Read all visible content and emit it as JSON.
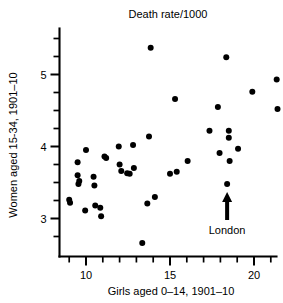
{
  "chart_data": {
    "type": "scatter",
    "title": "Death rate/1000",
    "xlabel": "Girls aged 0–14, 1901–10",
    "ylabel": "Women aged 15-34, 1901–10",
    "xlim": [
      8.8,
      22.0
    ],
    "ylim": [
      2.55,
      5.55
    ],
    "xticks_labeled": [
      10,
      15,
      20
    ],
    "xtick_labels": [
      "10",
      "15",
      "20"
    ],
    "xticks_all": [
      9,
      10,
      11,
      12,
      13,
      14,
      15,
      16,
      17,
      18,
      19,
      20,
      21,
      22
    ],
    "yticks_labeled": [
      3,
      4,
      5
    ],
    "ytick_labels": [
      "3",
      "4",
      "5"
    ],
    "yticks_all": [
      2.75,
      3.0,
      3.25,
      3.5,
      3.75,
      4.0,
      4.25,
      4.5,
      4.75,
      5.0,
      5.25,
      5.5
    ],
    "grid": false,
    "legend": false,
    "marker_color": "#000000",
    "points": [
      {
        "x": 9.0,
        "y": 3.26
      },
      {
        "x": 9.05,
        "y": 3.22
      },
      {
        "x": 9.5,
        "y": 3.78
      },
      {
        "x": 9.5,
        "y": 3.6
      },
      {
        "x": 9.55,
        "y": 3.48
      },
      {
        "x": 9.6,
        "y": 3.52
      },
      {
        "x": 9.95,
        "y": 3.11
      },
      {
        "x": 10.0,
        "y": 3.95
      },
      {
        "x": 10.45,
        "y": 3.58
      },
      {
        "x": 10.5,
        "y": 3.46
      },
      {
        "x": 10.55,
        "y": 3.18
      },
      {
        "x": 10.85,
        "y": 3.15
      },
      {
        "x": 10.9,
        "y": 3.03
      },
      {
        "x": 11.1,
        "y": 3.86
      },
      {
        "x": 11.2,
        "y": 3.84
      },
      {
        "x": 11.95,
        "y": 4.0
      },
      {
        "x": 12.0,
        "y": 3.75
      },
      {
        "x": 12.1,
        "y": 3.66
      },
      {
        "x": 12.45,
        "y": 3.63
      },
      {
        "x": 12.6,
        "y": 3.62
      },
      {
        "x": 12.8,
        "y": 4.02
      },
      {
        "x": 12.85,
        "y": 3.7
      },
      {
        "x": 13.35,
        "y": 2.66
      },
      {
        "x": 13.65,
        "y": 3.21
      },
      {
        "x": 13.75,
        "y": 4.14
      },
      {
        "x": 13.85,
        "y": 5.37
      },
      {
        "x": 14.1,
        "y": 3.3
      },
      {
        "x": 15.0,
        "y": 3.62
      },
      {
        "x": 15.3,
        "y": 4.66
      },
      {
        "x": 15.4,
        "y": 3.65
      },
      {
        "x": 16.05,
        "y": 3.8
      },
      {
        "x": 17.35,
        "y": 4.22
      },
      {
        "x": 17.85,
        "y": 4.55
      },
      {
        "x": 17.95,
        "y": 3.91
      },
      {
        "x": 18.35,
        "y": 5.24
      },
      {
        "x": 18.4,
        "y": 3.48
      },
      {
        "x": 18.5,
        "y": 4.22
      },
      {
        "x": 18.5,
        "y": 4.12
      },
      {
        "x": 18.55,
        "y": 3.8
      },
      {
        "x": 19.05,
        "y": 3.97
      },
      {
        "x": 19.9,
        "y": 4.76
      },
      {
        "x": 21.35,
        "y": 4.93
      },
      {
        "x": 21.4,
        "y": 4.52
      }
    ],
    "annotations": [
      {
        "label": "London",
        "target_x": 18.4,
        "target_y": 3.48,
        "arrow": "up-arrow"
      }
    ]
  }
}
